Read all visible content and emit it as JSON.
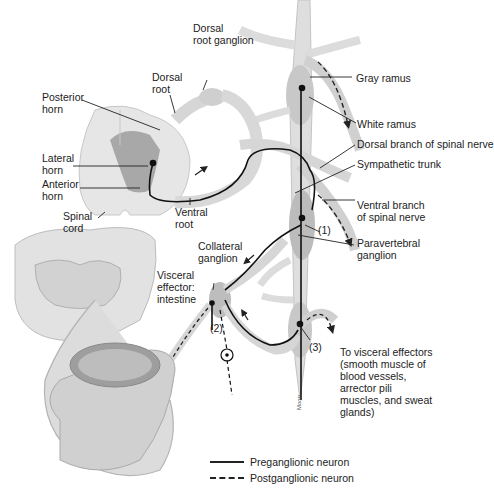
{
  "figure": {
    "labels": {
      "dorsal_root_ganglion": "Dorsal\nroot ganglion",
      "dorsal_root": "Dorsal\nroot",
      "posterior_horn": "Posterior\nhorn",
      "lateral_horn": "Lateral\nhorn",
      "anterior_horn": "Anterior\nhorn",
      "spinal_cord": "Spinal\ncord",
      "ventral_root": "Ventral\nroot",
      "collateral_ganglion": "Collateral\nganglion",
      "visceral_effector": "Visceral\neffector:\nintestine",
      "gray_ramus": "Gray ramus",
      "white_ramus": "White ramus",
      "dorsal_branch": "Dorsal branch of spinal nerve",
      "sympathetic_trunk": "Sympathetic trunk",
      "ventral_branch": "Ventral branch\nof spinal nerve",
      "paravertebral_ganglion": "Paravertebral\nganglion",
      "to_visceral_effectors": "To visceral effectors\n(smooth muscle of\nblood vessels,\narrector pili\nmuscles, and sweat\nglands)",
      "pathway_1": "(1)",
      "pathway_2": "(2)",
      "pathway_3": "(3)"
    },
    "artist_credit": "Moon",
    "legend": [
      {
        "style": "solid",
        "label": "Preganglionic neuron"
      },
      {
        "style": "dashed",
        "label": "Postganglionic neuron"
      }
    ],
    "colors": {
      "tissue": "#d9d9d9",
      "tissue_dark": "#b3b3b3",
      "gray_matter": "#a8a8a8",
      "nerve_line": "#111111",
      "leader_line": "#222222"
    }
  }
}
